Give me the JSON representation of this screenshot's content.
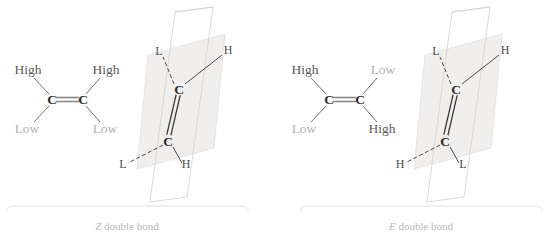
{
  "figure": {
    "background_color": "#ffffff",
    "panels": [
      {
        "id": "z-panel",
        "caption_prefix": "Z",
        "caption_rest": " double bond",
        "skeletal": {
          "atoms": [
            "C",
            "C"
          ],
          "bond_type": "double",
          "labels": {
            "top_left": "High",
            "top_right": "High",
            "bottom_left": "Low",
            "bottom_right": "Low"
          }
        },
        "perspective": {
          "atoms": [
            "C",
            "C"
          ],
          "bond_type": "double",
          "labels": {
            "upper_back": "L",
            "upper_front": "H",
            "lower_back": "L",
            "lower_front": "H"
          }
        }
      },
      {
        "id": "e-panel",
        "caption_prefix": "E",
        "caption_rest": " double bond",
        "skeletal": {
          "atoms": [
            "C",
            "C"
          ],
          "bond_type": "double",
          "labels": {
            "top_left": "High",
            "top_right": "Low",
            "bottom_left": "Low",
            "bottom_right": "High"
          }
        },
        "perspective": {
          "atoms": [
            "C",
            "C"
          ],
          "bond_type": "double",
          "labels": {
            "upper_back": "L",
            "upper_front": "H",
            "lower_back": "H",
            "lower_front": "L"
          }
        }
      }
    ],
    "colors": {
      "high_label": "#595959",
      "low_label": "#b3b1ae",
      "atom": "#2b2b2b",
      "bond": "#6f6f6f",
      "plane_fill": "#f0efed",
      "plane_stroke": "#d9d7d4",
      "caption": "#b9b7b4",
      "brace": "#dedcd9"
    }
  }
}
